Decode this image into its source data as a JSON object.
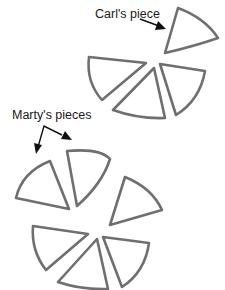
{
  "labels": {
    "carl": "Carl's piece",
    "marty": "Marty's pieces"
  },
  "colors": {
    "stroke": "#6f6f6f",
    "text": "#1a1a1a",
    "arrow": "#111111",
    "background": "#ffffff"
  },
  "groups": [
    {
      "name": "top-pizza",
      "pieces": 4,
      "note": "one piece separated and labeled as Carl's"
    },
    {
      "name": "bottom-pizza",
      "pieces": 6,
      "note": "two pieces labeled as Marty's"
    }
  ]
}
